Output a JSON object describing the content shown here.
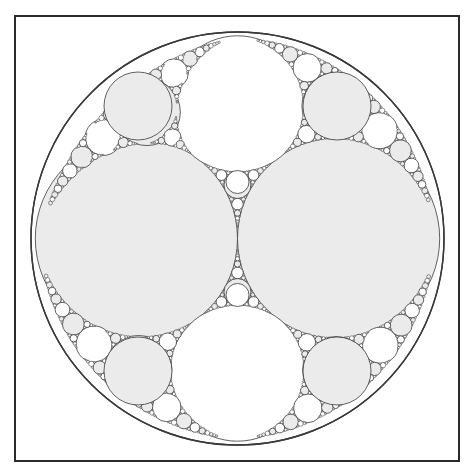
{
  "page": {
    "background_color": "#ffffff",
    "width": 474,
    "height": 476
  },
  "caption": {
    "text": "",
    "color": "#cfcfcf"
  },
  "frame": {
    "label": "figure-frame",
    "x": 14,
    "y": 15,
    "width": 446,
    "height": 447,
    "border_color": "#2b2b2b",
    "border_width": 2,
    "fill": "#ffffff"
  },
  "style": {
    "stroke_color": "#3a3a3a",
    "stroke_width": 0.8,
    "filled_color": "#ebebeb",
    "unfilled_color": "#ffffff",
    "outer_stroke_width": 1.4
  },
  "chart_data": {
    "type": "scatter",
    "subtitle": "Integral Apollonian circle packing, symmetric (2,2,3,3) seed",
    "xlabel": "",
    "ylabel": "",
    "xlim": [
      30,
      445
    ],
    "ylim": [
      32,
      445
    ],
    "grid": false,
    "legend": "none",
    "annotations": [],
    "geometry": {
      "outer_circle": {
        "cx": 237.5,
        "cy": 238.5,
        "r": 206.5,
        "fill": "none",
        "generation": 0
      },
      "seed_circles": [
        {
          "name": "left-major-circle",
          "cx": 136.4,
          "cy": 238.5,
          "r": 101.1,
          "fill": "grey",
          "generation": 1
        },
        {
          "name": "right-major-circle",
          "cx": 338.6,
          "cy": 238.5,
          "r": 101.1,
          "fill": "grey",
          "generation": 1
        },
        {
          "name": "top-major-circle",
          "cx": 237.5,
          "cy": 104.0,
          "r": 68.2,
          "fill": "white",
          "generation": 1
        },
        {
          "name": "bottom-major-circle",
          "cx": 237.5,
          "cy": 373.0,
          "r": 68.2,
          "fill": "white",
          "generation": 1
        }
      ],
      "secondary_circles": [
        {
          "name": "upper-left-grey-circle",
          "cx": 138.0,
          "cy": 106.0,
          "r": 34.0,
          "fill": "grey"
        },
        {
          "name": "upper-right-grey-circle",
          "cx": 337.0,
          "cy": 106.0,
          "r": 34.0,
          "fill": "grey"
        },
        {
          "name": "lower-left-grey-circle",
          "cx": 138.0,
          "cy": 371.0,
          "r": 34.0,
          "fill": "grey"
        },
        {
          "name": "lower-right-grey-circle",
          "cx": 337.0,
          "cy": 371.0,
          "r": 34.0,
          "fill": "grey"
        },
        {
          "name": "center-upper-white-circle",
          "cx": 237.5,
          "cy": 182.0,
          "r": 11.5,
          "fill": "white"
        },
        {
          "name": "center-lower-white-circle",
          "cx": 237.5,
          "cy": 295.0,
          "r": 11.5,
          "fill": "white"
        }
      ],
      "curvature_seed": [
        -1,
        2,
        2,
        3,
        3
      ],
      "recursion_depth": 9,
      "min_radius_px": 0.55,
      "total_circles_drawn": "~3000"
    }
  },
  "controls": {
    "canvas_label": "gasket-canvas"
  }
}
